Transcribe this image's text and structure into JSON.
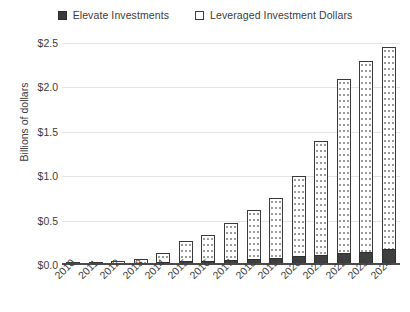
{
  "chart_data": {
    "type": "bar",
    "subtype": "stacked-vertical-bar",
    "title": "",
    "xlabel": "",
    "ylabel": "Billions of dollars",
    "ylim": [
      0.0,
      2.5
    ],
    "yticks": [
      0.0,
      0.5,
      1.0,
      1.5,
      2.0,
      2.5
    ],
    "ytick_labels": [
      "$0.0",
      "$0.5",
      "$1.0",
      "$1.5",
      "$2.0",
      "$2.5"
    ],
    "grid": true,
    "legend_position": "top-center",
    "categories": [
      "2010",
      "2011",
      "2012",
      "2013",
      "2014",
      "2015",
      "2016",
      "2017",
      "2018",
      "2019",
      "2020",
      "2021",
      "2022",
      "2023",
      "2024"
    ],
    "series": [
      {
        "name": "Elevate Investments",
        "color": "#3f3f3f",
        "swatch": "filled-square",
        "values": [
          0.005,
          0.01,
          0.02,
          0.02,
          0.03,
          0.04,
          0.05,
          0.06,
          0.07,
          0.08,
          0.1,
          0.11,
          0.13,
          0.15,
          0.18
        ]
      },
      {
        "name": "Leveraged Investment Dollars",
        "color": "#ffffff",
        "swatch": "open-square",
        "values": [
          0.005,
          0.01,
          0.02,
          0.04,
          0.11,
          0.23,
          0.29,
          0.41,
          0.55,
          0.68,
          0.9,
          1.29,
          1.97,
          2.15,
          2.28
        ]
      }
    ],
    "totals": [
      0.01,
      0.02,
      0.04,
      0.06,
      0.14,
      0.27,
      0.34,
      0.47,
      0.62,
      0.76,
      1.0,
      1.4,
      2.1,
      2.3,
      2.46
    ],
    "colors": {
      "elevate": "#3f3f3f",
      "leveraged": "#ffffff",
      "bar_outline": "#3a3a3a",
      "gridline": "#e3e3e3",
      "axis": "#4a4a4a",
      "text": "#3b3b3b"
    }
  },
  "legend": {
    "entries": [
      {
        "label": "Elevate Investments",
        "swatch": "filled-square-icon"
      },
      {
        "label": "Leveraged Investment Dollars",
        "swatch": "open-square-icon"
      }
    ]
  },
  "axes": {
    "y": {
      "title": "Billions of dollars",
      "ticks": [
        "$2.5",
        "$2.0",
        "$1.5",
        "$1.0",
        "$0.5",
        "$0.0"
      ]
    },
    "x": {
      "ticks": [
        "2010",
        "2011",
        "2012",
        "2013",
        "2014",
        "2015",
        "2016",
        "2017",
        "2018",
        "2019",
        "2020",
        "2021",
        "2022",
        "2023",
        "2024"
      ]
    }
  }
}
